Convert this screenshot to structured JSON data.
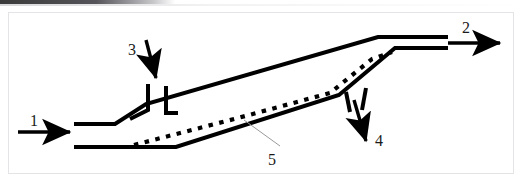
{
  "figure": {
    "type": "technical-line-diagram",
    "canvas": {
      "width": 523,
      "height": 187
    },
    "background_color": "#ffffff",
    "line_color": "#000000",
    "leader_color": "#9a9a9a",
    "border_color": "#e2e2e2",
    "labels": [
      {
        "id": "1",
        "text": "1",
        "meaning": "inlet-flow-arrow",
        "x": 30,
        "y": 113
      },
      {
        "id": "2",
        "text": "2",
        "meaning": "outlet-flow-arrow",
        "x": 462,
        "y": 20
      },
      {
        "id": "3",
        "text": "3",
        "meaning": "upper-branch-inlet-arrow",
        "x": 128,
        "y": 42
      },
      {
        "id": "4",
        "text": "4",
        "meaning": "lower-branch-outlet-arrow",
        "x": 375,
        "y": 133
      },
      {
        "id": "5",
        "text": "5",
        "meaning": "dotted-centerline-callout",
        "x": 268,
        "y": 152
      }
    ],
    "arrows": {
      "inlet_1": {
        "label": "1",
        "direction": "right",
        "from_x": 18,
        "from_y": 132,
        "to_x": 78,
        "to_y": 132
      },
      "outlet_2": {
        "label": "2",
        "direction": "right",
        "from_x": 448,
        "from_y": 43,
        "to_x": 508,
        "to_y": 43
      },
      "branch_in_3": {
        "label": "3",
        "direction": "down",
        "from_x": 146,
        "from_y": 40,
        "to_x": 156,
        "to_y": 84
      },
      "branch_out_4": {
        "label": "4",
        "direction": "down-right",
        "from_x": 354,
        "from_y": 100,
        "to_x": 366,
        "to_y": 147
      }
    },
    "centerline": {
      "style": "dotted",
      "label": "5",
      "note": "dotted line running along the inclined duct axis"
    }
  }
}
